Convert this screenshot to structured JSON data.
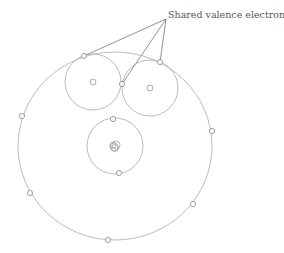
{
  "diagram": {
    "label": "Shared valence electrons",
    "colors": {
      "line": "#aaaaaa",
      "leader": "#777777",
      "text": "#555555",
      "background": "#ffffff"
    },
    "atoms": [
      {
        "name": "oxygen-outer-shell",
        "cx": 115,
        "cy": 146,
        "r": 95
      },
      {
        "name": "oxygen-inner-shell",
        "cx": 115,
        "cy": 146,
        "r": 28
      },
      {
        "name": "hydrogen-left",
        "cx": 93,
        "cy": 82,
        "r": 28
      },
      {
        "name": "hydrogen-right",
        "cx": 150,
        "cy": 88,
        "r": 28
      }
    ],
    "shared_electrons": [
      {
        "x": 84,
        "y": 56
      },
      {
        "x": 122,
        "y": 84
      },
      {
        "x": 160,
        "y": 62
      }
    ],
    "outer_electrons": [
      {
        "x": 22,
        "y": 116
      },
      {
        "x": 30,
        "y": 193
      },
      {
        "x": 108,
        "y": 240
      },
      {
        "x": 193,
        "y": 204
      },
      {
        "x": 212,
        "y": 131
      }
    ],
    "inner_electrons": [
      {
        "x": 113,
        "y": 119
      },
      {
        "x": 119,
        "y": 173
      }
    ]
  }
}
